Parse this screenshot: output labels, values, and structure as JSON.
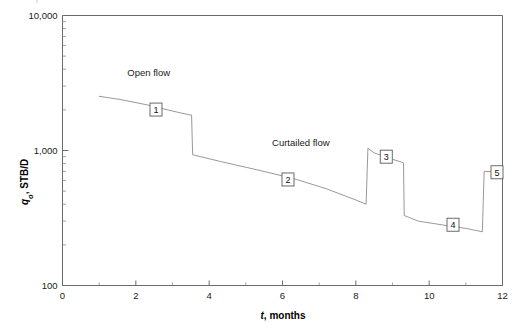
{
  "chart_data": {
    "type": "line",
    "title": "",
    "xlabel": "t, months",
    "ylabel": "qo, STB/D",
    "ylabel_base": "q",
    "ylabel_sub": "o",
    "ylabel_rest": ", STB/D",
    "xlabel_italic": "t",
    "xlabel_rest": ", months",
    "xscale": "linear",
    "yscale": "log",
    "xlim": [
      0,
      12
    ],
    "ylim": [
      100,
      10000
    ],
    "grid": false,
    "legend": "none",
    "xticks": [
      0,
      2,
      4,
      6,
      8,
      10,
      12
    ],
    "xticklabels": [
      "0",
      "2",
      "4",
      "6",
      "8",
      "10",
      "12"
    ],
    "xminorticks": [
      1,
      3,
      5,
      7,
      9,
      11
    ],
    "yticks": [
      100,
      1000,
      10000
    ],
    "yticklabels": [
      "100",
      "1,000",
      "10,000"
    ],
    "yminorticks": [
      200,
      300,
      400,
      500,
      600,
      700,
      800,
      900,
      2000,
      3000,
      4000,
      5000,
      6000,
      7000,
      8000,
      9000
    ],
    "line_color": "#8d8d8d",
    "axis_color": "#6b6b6b",
    "series": [
      {
        "name": "oil rate",
        "x": [
          1.0,
          1.6,
          2.3,
          3.0,
          3.45,
          3.52,
          3.55,
          4.3,
          5.3,
          6.3,
          7.2,
          8.0,
          8.28,
          8.33,
          8.5,
          9.0,
          9.25,
          9.3,
          9.32,
          9.7,
          10.4,
          11.0,
          11.45,
          11.5,
          11.55,
          11.9
        ],
        "y": [
          2520,
          2380,
          2180,
          1960,
          1840,
          1830,
          930,
          830,
          720,
          620,
          520,
          430,
          400,
          1040,
          960,
          860,
          820,
          810,
          330,
          300,
          280,
          265,
          250,
          700,
          700,
          690
        ]
      }
    ],
    "annotations": [
      {
        "id": "open-flow",
        "text": "Open flow",
        "x": 2.35,
        "y": 3550
      },
      {
        "id": "curtailed-flow",
        "text": "Curtailed flow",
        "x": 6.5,
        "y": 1080
      }
    ],
    "markers": [
      {
        "label": "1",
        "x": 2.55,
        "y": 2010
      },
      {
        "label": "2",
        "x": 6.15,
        "y": 610
      },
      {
        "label": "3",
        "x": 8.83,
        "y": 900
      },
      {
        "label": "4",
        "x": 10.65,
        "y": 282
      },
      {
        "label": "5",
        "x": 11.85,
        "y": 690
      }
    ]
  }
}
